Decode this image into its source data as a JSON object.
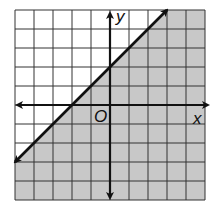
{
  "chart_data": {
    "type": "line",
    "title": "",
    "xlabel": "x",
    "ylabel": "y",
    "origin_label": "O",
    "xlim": [
      -5,
      5
    ],
    "ylim": [
      -5,
      5
    ],
    "grid": true,
    "grid_step": 1,
    "series": [
      {
        "name": "boundary line y = x + 2",
        "style": "solid",
        "x": [
          -5,
          3
        ],
        "y": [
          -3,
          5
        ],
        "slope": 1,
        "intercept": 2,
        "arrows": "both"
      }
    ],
    "shaded_region": {
      "inequality": "y <= x + 2",
      "side": "below-right",
      "color": "#c8c8c8"
    }
  },
  "colors": {
    "grid": "#333333",
    "axes": "#111111",
    "shade": "#c8c8c8",
    "background": "#ffffff"
  }
}
